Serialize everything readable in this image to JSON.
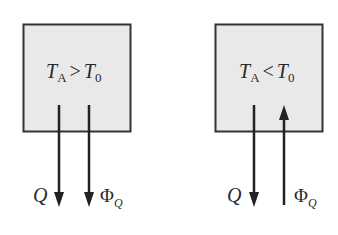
{
  "panels": [
    {
      "condition": {
        "T": "T",
        "sub_A": "A",
        "op": ">",
        "T0": "T",
        "sub_0": "0"
      },
      "arrows": [
        {
          "label": "Q",
          "direction": "down"
        },
        {
          "label": "Φ",
          "label_sub": "Q",
          "direction": "down"
        }
      ]
    },
    {
      "condition": {
        "T": "T",
        "sub_A": "A",
        "op": "<",
        "T0": "T",
        "sub_0": "0"
      },
      "arrows": [
        {
          "label": "Q",
          "direction": "down"
        },
        {
          "label": "Φ",
          "label_sub": "Q",
          "direction": "up"
        }
      ]
    }
  ],
  "colors": {
    "box_fill": "#e9e9e9",
    "box_stroke": "#333333",
    "arrow": "#222222"
  }
}
